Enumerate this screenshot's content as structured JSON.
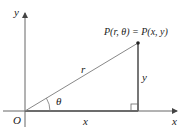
{
  "diagram": {
    "type": "polar-to-cartesian",
    "labels": {
      "y_axis": "y",
      "x_axis": "x",
      "origin": "O",
      "point": "P(r, θ) = P(x, y)",
      "hypotenuse": "r",
      "vertical_side": "y",
      "horizontal_side": "x",
      "angle": "θ"
    },
    "colors": {
      "axis": "#555555",
      "line": "#777777",
      "text": "#222222"
    }
  }
}
